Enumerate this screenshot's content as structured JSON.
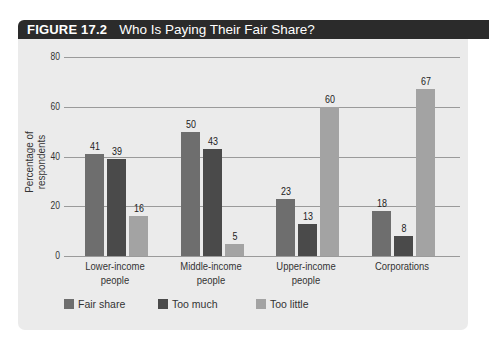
{
  "figure": {
    "number": "FIGURE 17.2",
    "title": "Who Is Paying Their Fair Share?"
  },
  "colors": {
    "header_bg": "#2b2b2b",
    "panel_bg": "#ebebeb",
    "fair_share": "#6e6e6e",
    "too_much": "#4a4a4a",
    "too_little": "#a3a3a3"
  },
  "chart_data": {
    "type": "bar",
    "title": "Who Is Paying Their Fair Share?",
    "xlabel": "",
    "ylabel": "Percentage of respondents",
    "ylim": [
      0,
      80
    ],
    "yticks": [
      "0",
      "20",
      "40",
      "60",
      "80"
    ],
    "grid": true,
    "legend_position": "bottom",
    "categories": [
      "Lower-income people",
      "Middle-income people",
      "Upper-income people",
      "Corporations"
    ],
    "category_lines": [
      [
        "Lower-income",
        "people"
      ],
      [
        "Middle-income",
        "people"
      ],
      [
        "Upper-income",
        "people"
      ],
      [
        "Corporations",
        ""
      ]
    ],
    "series": [
      {
        "name": "Fair share",
        "values": [
          41,
          50,
          23,
          18
        ]
      },
      {
        "name": "Too much",
        "values": [
          39,
          43,
          13,
          8
        ]
      },
      {
        "name": "Too little",
        "values": [
          16,
          5,
          60,
          67
        ]
      }
    ]
  }
}
